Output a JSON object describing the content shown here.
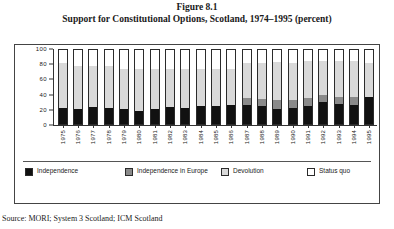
{
  "figure": {
    "number": "Figure 8.1",
    "title": "Support for Constitutional Options, Scotland, 1974–1995 (percent)",
    "source": "Source: MORI; System 3 Scotland; ICM Scotland"
  },
  "legend": {
    "items": [
      {
        "label": "Independence",
        "color": "#111111",
        "swatch": "swatch-independence"
      },
      {
        "label": "Independence in Europe",
        "color": "#8a8a8a",
        "swatch": "swatch-independence-europe"
      },
      {
        "label": "Devolution",
        "color": "#d9d9d9",
        "swatch": "swatch-devolution"
      },
      {
        "label": "Status quo",
        "color": "#ffffff",
        "swatch": "swatch-status-quo"
      }
    ]
  },
  "chart_data": {
    "type": "bar",
    "stacked": true,
    "title": "Support for Constitutional Options, Scotland, 1974–1995 (percent)",
    "xlabel": "",
    "ylabel": "",
    "ylim": [
      0,
      100
    ],
    "yticks": [
      0,
      20,
      40,
      60,
      80,
      100
    ],
    "grid": false,
    "legend_position": "bottom",
    "categories": [
      "1975",
      "1976",
      "1977",
      "1978",
      "1979",
      "1980",
      "1981",
      "1982",
      "1983",
      "1984",
      "1985",
      "1986",
      "1987",
      "1988",
      "1989",
      "1990",
      "1991",
      "1992",
      "1993",
      "1994",
      "1995"
    ],
    "series": [
      {
        "name": "Independence",
        "color": "#111111",
        "values": [
          21,
          20,
          23,
          22,
          20,
          18,
          20,
          23,
          22,
          24,
          25,
          26,
          26,
          24,
          20,
          22,
          25,
          30,
          27,
          26,
          37
        ]
      },
      {
        "name": "Independence in Europe",
        "color": "#8a8a8a",
        "values": [
          0,
          0,
          0,
          0,
          0,
          0,
          0,
          0,
          0,
          0,
          0,
          0,
          9,
          10,
          12,
          11,
          10,
          9,
          10,
          11,
          0
        ]
      },
      {
        "name": "Devolution",
        "color": "#d9d9d9",
        "values": [
          62,
          58,
          55,
          56,
          55,
          57,
          54,
          51,
          52,
          50,
          50,
          49,
          48,
          49,
          52,
          50,
          50,
          46,
          48,
          48,
          45
        ]
      },
      {
        "name": "Status quo",
        "color": "#ffffff",
        "values": [
          17,
          22,
          22,
          22,
          25,
          25,
          26,
          26,
          26,
          26,
          25,
          25,
          17,
          17,
          16,
          17,
          15,
          15,
          15,
          15,
          18
        ]
      }
    ]
  }
}
